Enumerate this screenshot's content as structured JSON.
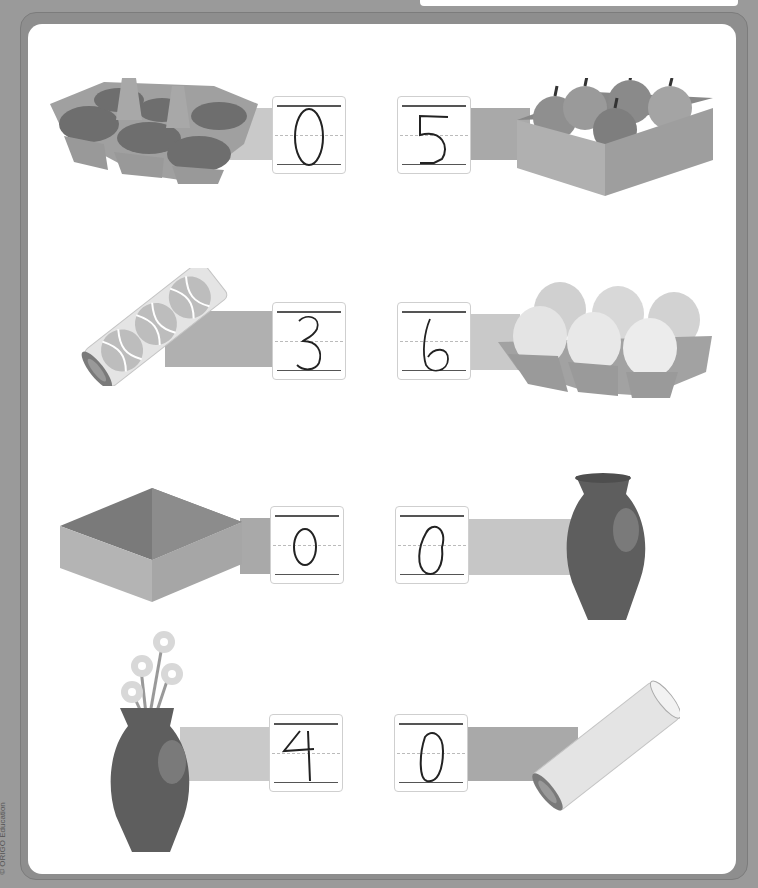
{
  "worksheet": {
    "copyright": "© ORIGO Education",
    "band_colors": {
      "light": "#c9c9c9",
      "medium": "#a9a9a9"
    },
    "rows": [
      {
        "left": {
          "object": "empty-egg-carton",
          "answer": "0"
        },
        "right": {
          "object": "box-of-5-apples",
          "answer": "5"
        }
      },
      {
        "left": {
          "object": "tube-of-3-tennis-balls",
          "answer": "3"
        },
        "right": {
          "object": "carton-of-6-eggs",
          "answer": "6"
        }
      },
      {
        "left": {
          "object": "empty-box",
          "answer": "0"
        },
        "right": {
          "object": "empty-vase",
          "answer": "0"
        }
      },
      {
        "left": {
          "object": "vase-with-4-flowers",
          "answer": "4"
        },
        "right": {
          "object": "empty-tube",
          "answer": "0"
        }
      }
    ]
  }
}
